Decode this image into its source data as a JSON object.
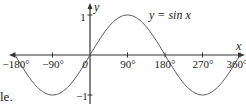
{
  "chart_data": {
    "type": "line",
    "title": "",
    "curve_label": "y = sin x",
    "xlabel": "x",
    "ylabel": "y",
    "x_ticks": [
      "−180°",
      "−90°",
      "0",
      "90°",
      "180°",
      "270°",
      "360°"
    ],
    "x_tick_values": [
      -180,
      -90,
      0,
      90,
      180,
      270,
      360
    ],
    "y_ticks": [
      "1",
      "−1"
    ],
    "y_tick_values": [
      1,
      -1
    ],
    "xlim": [
      -180,
      360
    ],
    "ylim": [
      -1,
      1
    ],
    "grid": false,
    "series": [
      {
        "name": "y = sin x",
        "x": [
          -180,
          -135,
          -90,
          -45,
          0,
          45,
          90,
          135,
          180,
          225,
          270,
          315,
          360
        ],
        "values": [
          0,
          -0.707,
          -1,
          -0.707,
          0,
          0.707,
          1,
          0.707,
          0,
          -0.707,
          -1,
          -0.707,
          0
        ]
      }
    ]
  },
  "fragment_text": "le."
}
